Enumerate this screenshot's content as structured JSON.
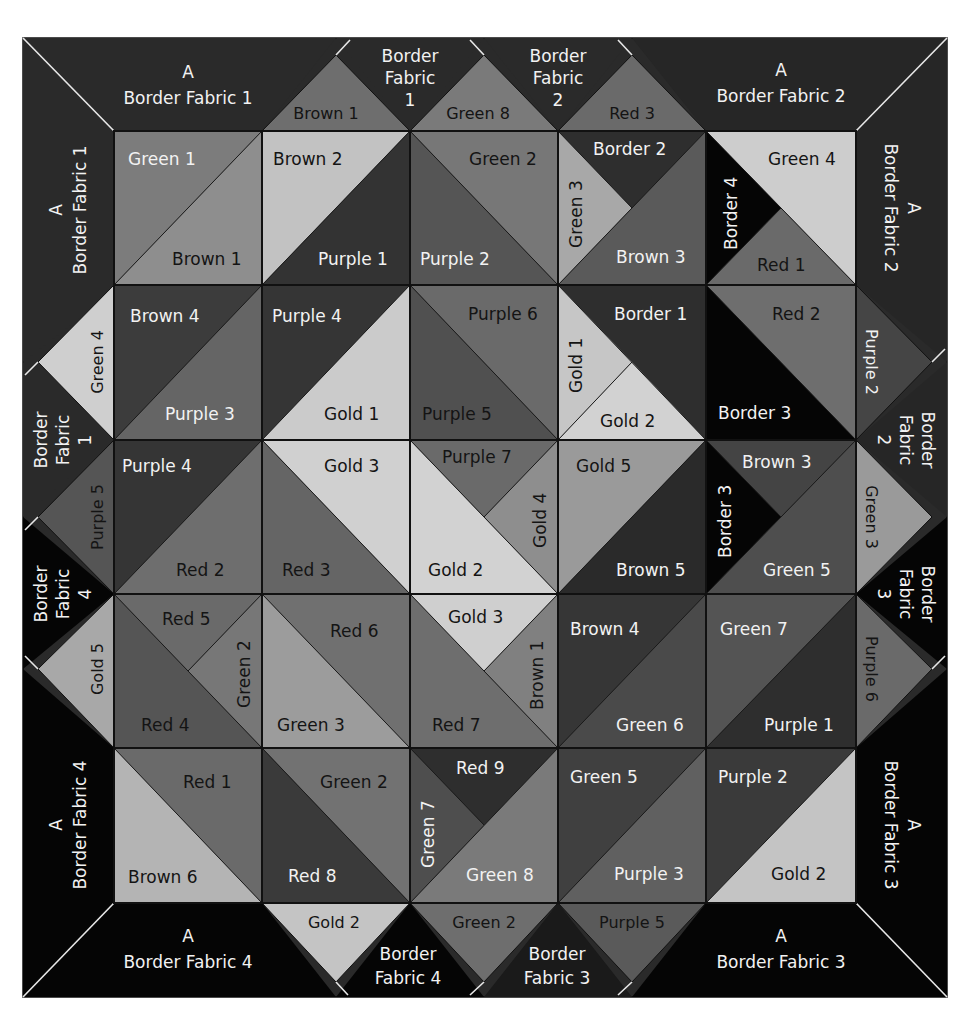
{
  "palette": {
    "frame": "#2a2a2a",
    "border_dark": "#262626",
    "border_black": "#050505",
    "brown_light": "#bdbdbd",
    "gold_light": "#cfcfcf",
    "gold_mid": "#bcbcbc",
    "green_mid": "#8a8a8a",
    "green_light": "#a6a6a6",
    "green_dark": "#4a4a4a",
    "red_mid": "#727272",
    "red_dark": "#5a5a5a",
    "purple_dark": "#333333",
    "purple_mid": "#555555",
    "brown_dark": "#3c3c3c",
    "text_light": "#f2f2f2",
    "text_dark": "#141414"
  },
  "corners": [
    {
      "name": "corner-top-left-h",
      "line1": "A",
      "line2": "Border Fabric 1"
    },
    {
      "name": "corner-top-left-v",
      "line1": "A",
      "line2": "Border Fabric 1"
    },
    {
      "name": "corner-top-right-h",
      "line1": "A",
      "line2": "Border Fabric 2"
    },
    {
      "name": "corner-top-right-v",
      "line1": "A",
      "line2": "Border Fabric 2"
    },
    {
      "name": "corner-bottom-left-h",
      "line1": "A",
      "line2": "Border Fabric 4"
    },
    {
      "name": "corner-bottom-left-v",
      "line1": "A",
      "line2": "Border Fabric 4"
    },
    {
      "name": "corner-bottom-right-h",
      "line1": "A",
      "line2": "Border Fabric 3"
    },
    {
      "name": "corner-bottom-right-v",
      "line1": "A",
      "line2": "Border Fabric 3"
    }
  ],
  "setting_triangles": {
    "top": [
      "Brown 1",
      "Green 8",
      "Red 3"
    ],
    "top_gaps": [
      {
        "l1": "Border",
        "l2": "Fabric",
        "l3": "1"
      },
      {
        "l1": "Border",
        "l2": "Fabric",
        "l3": "2"
      }
    ],
    "bottom": [
      "Gold 2",
      "Green 2",
      "Purple 5"
    ],
    "bottom_gaps": [
      {
        "l1": "Border",
        "l2": "Fabric 4"
      },
      {
        "l1": "Border",
        "l2": "Fabric 3"
      }
    ],
    "left": [
      "Green 4",
      "Purple 5",
      "Gold 5"
    ],
    "left_gaps": [
      {
        "l1": "Border",
        "l2": "Fabric",
        "l3": "1"
      },
      {
        "l1": "Border",
        "l2": "Fabric",
        "l3": "4"
      }
    ],
    "right": [
      "Purple 2",
      "Green 3",
      "Purple 6"
    ],
    "right_gaps": [
      {
        "l1": "Border",
        "l2": "Fabric",
        "l3": "2"
      },
      {
        "l1": "Border",
        "l2": "Fabric",
        "l3": "3"
      }
    ]
  },
  "blocks": {
    "r1c1": {
      "a": "Green 1",
      "b": "Brown 1"
    },
    "r1c2": {
      "a": "Brown 2",
      "b": "Purple 1"
    },
    "r1c3": {
      "a": "Green 2",
      "b": "Purple 2"
    },
    "r1c4": {
      "top": "Border 2",
      "left": "Green 3",
      "bottom": "Brown 3"
    },
    "r1c5": {
      "top": "Green 4",
      "left": "Border 4",
      "bottom": "Red 1"
    },
    "r2c1": {
      "a": "Brown 4",
      "b": "Purple 3"
    },
    "r2c2": {
      "a": "Purple 4",
      "b": "Gold 1"
    },
    "r2c3": {
      "a": "Purple 6",
      "b": "Purple 5"
    },
    "r2c4": {
      "top": "Border 1",
      "left": "Gold 1",
      "bottom": "Gold 2"
    },
    "r2c5": {
      "a": "Red 2",
      "b": "Border 3"
    },
    "r3c1": {
      "a": "Purple 4",
      "b": "Red 2"
    },
    "r3c2": {
      "a": "Gold 3",
      "b": "Red 3"
    },
    "r3c3": {
      "top": "Purple 7",
      "right": "Gold 4",
      "bottom": "Gold 2"
    },
    "r3c4": {
      "a": "Gold 5",
      "b": "Brown 5"
    },
    "r3c5": {
      "top": "Brown 3",
      "left": "Border 3",
      "bottom": "Green 5"
    },
    "r4c1": {
      "top": "Red 5",
      "right": "Green 2",
      "bottom": "Red 4"
    },
    "r4c2": {
      "a": "Red 6",
      "b": "Green 3"
    },
    "r4c3": {
      "top": "Gold 3",
      "right": "Brown 1",
      "bottom": "Red 7"
    },
    "r4c4": {
      "a": "Brown 4",
      "b": "Green 6"
    },
    "r4c5": {
      "a": "Green 7",
      "b": "Purple 1"
    },
    "r5c1": {
      "a": "Red 1",
      "b": "Brown 6"
    },
    "r5c2": {
      "a": "Green 2",
      "b": "Red 8"
    },
    "r5c3": {
      "top": "Red 9",
      "left": "Green 7",
      "bottom": "Green 8"
    },
    "r5c4": {
      "a": "Green 5",
      "b": "Purple 3"
    },
    "r5c5": {
      "a": "Purple 2",
      "b": "Gold 2"
    }
  }
}
